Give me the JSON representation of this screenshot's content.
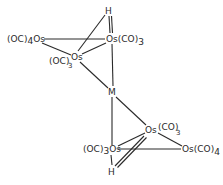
{
  "diagram": {
    "type": "chemical-structure",
    "stroke_color": "#2a2a2a",
    "background": "#ffffff",
    "labels": {
      "top_h": "H",
      "top_os_left": {
        "prefix": "(OC)",
        "sub": "4",
        "atom": "Os"
      },
      "top_os_right": {
        "atom": "Os",
        "suffix": "(CO)",
        "sub": "3"
      },
      "top_os_mid": {
        "prefix": "(OC)",
        "sub": "3",
        "atom": "Os"
      },
      "metal": "M",
      "bot_os_upper": {
        "atom": "Os",
        "suffix": "(CO)",
        "sub": "3"
      },
      "bot_os_left": {
        "prefix": "(OC)",
        "sub": "3",
        "atom": "Os"
      },
      "bot_os_right": {
        "atom": "Os",
        "suffix": "(CO)",
        "sub": "4"
      },
      "bot_h": "H"
    }
  }
}
